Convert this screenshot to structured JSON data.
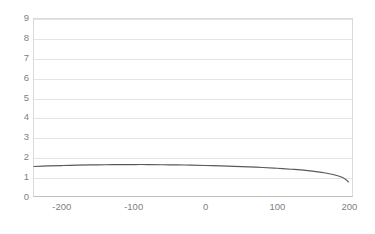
{
  "chart_data": {
    "type": "line",
    "title": "",
    "subtitle": "",
    "xlabel": "",
    "ylabel": "",
    "xlim": [
      -240,
      205
    ],
    "ylim": [
      0,
      9
    ],
    "x_ticks": [
      -200,
      -100,
      0,
      100,
      200
    ],
    "x_tick_labels": [
      "-200",
      "-100",
      "0",
      "100",
      "200"
    ],
    "y_ticks": [
      0,
      1,
      2,
      3,
      4,
      5,
      6,
      7,
      8,
      9
    ],
    "y_tick_labels": [
      "0",
      "1",
      "2",
      "3",
      "4",
      "5",
      "6",
      "7",
      "8",
      "9"
    ],
    "grid": {
      "horizontal": true,
      "vertical": false,
      "color": "#e4e4e4"
    },
    "legend": {
      "visible": false,
      "position": "none",
      "entries": []
    },
    "series": [
      {
        "name": "series-1",
        "color": "#595959",
        "line_width": 1.2,
        "markers": false,
        "x": [
          -240,
          -220,
          -200,
          -180,
          -160,
          -140,
          -120,
          -100,
          -80,
          -60,
          -40,
          -20,
          0,
          20,
          40,
          60,
          80,
          100,
          120,
          140,
          160,
          175,
          185,
          192,
          197,
          200
        ],
        "y": [
          1.5,
          1.53,
          1.55,
          1.57,
          1.58,
          1.59,
          1.6,
          1.6,
          1.6,
          1.59,
          1.58,
          1.57,
          1.55,
          1.53,
          1.51,
          1.48,
          1.45,
          1.41,
          1.36,
          1.3,
          1.21,
          1.12,
          1.03,
          0.94,
          0.82,
          0.72
        ]
      }
    ],
    "axis_line_color": "#bfbfbf",
    "tick_label_color": "#808080",
    "plot_background": "#ffffff"
  },
  "chart": {
    "x_axis_name": "x-axis",
    "y_axis_name": "y-axis"
  }
}
